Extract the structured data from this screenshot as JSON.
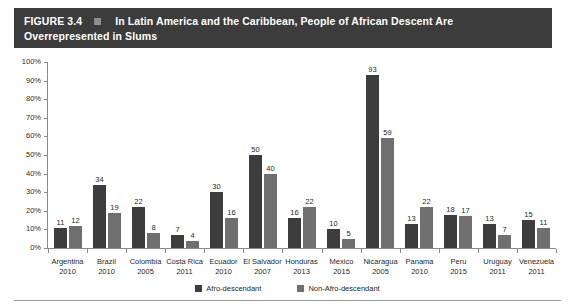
{
  "figure": {
    "number": "FIGURE 3.4",
    "bullet_icon": "square-bullet-icon",
    "title_line1": "In Latin America and the Caribbean, People of African Descent Are",
    "title_line2": "Overrepresented in Slums",
    "title_bar_color": "#3c3c3c",
    "title_text_color": "#ffffff"
  },
  "chart_data": {
    "type": "bar",
    "title": "In Latin America and the Caribbean, People of African Descent Are Overrepresented in Slums",
    "xlabel": "",
    "ylabel": "",
    "ylim": [
      0,
      100
    ],
    "ytick_labels": [
      "0%",
      "10%",
      "20%",
      "30%",
      "40%",
      "50%",
      "60%",
      "70%",
      "80%",
      "90%",
      "100%"
    ],
    "ytick_values": [
      0,
      10,
      20,
      30,
      40,
      50,
      60,
      70,
      80,
      90,
      100
    ],
    "grid": false,
    "legend_position": "bottom",
    "value_labels": true,
    "categories": [
      "Argentina",
      "Brazil",
      "Colombia",
      "Costa Rica",
      "Ecuador",
      "El Salvador",
      "Honduras",
      "Mexico",
      "Nicaragua",
      "Panama",
      "Peru",
      "Uruguay",
      "Venezuela"
    ],
    "category_years": [
      "2010",
      "2010",
      "2005",
      "2011",
      "2010",
      "2007",
      "2013",
      "2015",
      "2005",
      "2010",
      "2015",
      "2011",
      "2011"
    ],
    "series": [
      {
        "name": "Afro-descendant",
        "color": "#3d3d3d",
        "values": [
          11,
          34,
          22,
          7,
          30,
          50,
          16,
          10,
          93,
          13,
          18,
          13,
          15
        ]
      },
      {
        "name": "Non-Afro-descendant",
        "color": "#6f6f6f",
        "values": [
          12,
          19,
          8,
          4,
          16,
          40,
          22,
          5,
          59,
          22,
          17,
          7,
          11
        ]
      }
    ]
  }
}
